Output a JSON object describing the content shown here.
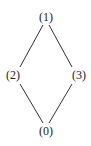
{
  "diagram": {
    "type": "hasse-diagram",
    "nodes": [
      {
        "id": "1",
        "label": "(1)",
        "x": 46,
        "y": 17
      },
      {
        "id": "2",
        "label": "(2)",
        "x": 13,
        "y": 75
      },
      {
        "id": "3",
        "label": "(3)",
        "x": 79,
        "y": 75
      },
      {
        "id": "0",
        "label": "(0)",
        "x": 46,
        "y": 131
      }
    ],
    "edges": [
      {
        "from": "1",
        "to": "2"
      },
      {
        "from": "1",
        "to": "3"
      },
      {
        "from": "2",
        "to": "0"
      },
      {
        "from": "3",
        "to": "0"
      }
    ],
    "colors": {
      "line": "#333333",
      "text": "#222222",
      "background": "#ffffff"
    }
  }
}
